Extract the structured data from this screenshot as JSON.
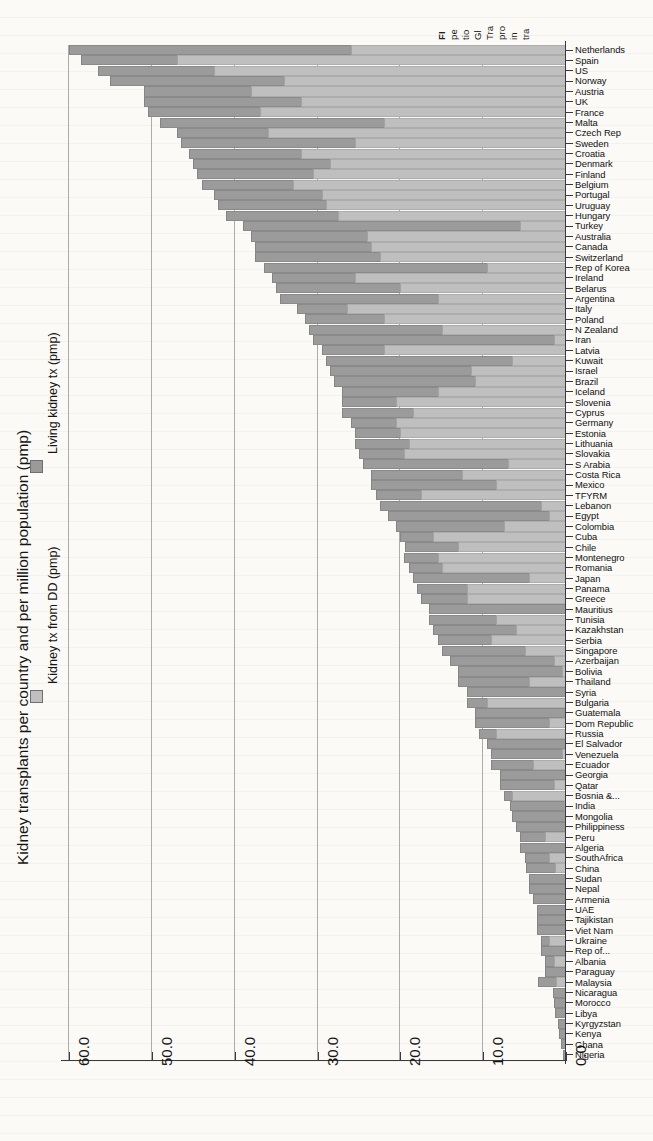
{
  "figure": {
    "caption_lines": [
      "FI",
      "pe",
      "tio",
      "Gl",
      "Tra",
      "pro",
      "in",
      "tra"
    ]
  },
  "axis": {
    "title": "Kidney transplants per country and per million population (pmp)",
    "tick_labels": [
      "60.0",
      "50.0",
      "40.0",
      "30.0",
      "20.0",
      "10.0",
      "0.0"
    ]
  },
  "legend": {
    "items": [
      {
        "label": "Kidney tx from DD (pmp)",
        "color": "#c0c0c0"
      },
      {
        "label": "Living kidney tx (pmp)",
        "color": "#9a9a9a"
      }
    ]
  },
  "chart_data": {
    "type": "bar",
    "orientation": "horizontal-stacked",
    "title": "Kidney transplants per country and per million population (pmp)",
    "xlabel": "Kidney transplants per country and per million population (pmp)",
    "ylabel": "",
    "xlim": [
      0,
      60
    ],
    "x_axis_reversed": true,
    "grid": true,
    "legend_position": "left",
    "ticks": [
      60.0,
      50.0,
      40.0,
      30.0,
      20.0,
      10.0,
      0.0
    ],
    "series": [
      {
        "name": "Kidney tx from DD (pmp)",
        "color": "#c0c0c0"
      },
      {
        "name": "Living kidney tx (pmp)",
        "color": "#9a9a9a"
      }
    ],
    "categories": [
      "Netherlands",
      "Spain",
      "US",
      "Norway",
      "Austria",
      "UK",
      "France",
      "Malta",
      "Czech Rep",
      "Sweden",
      "Croatia",
      "Denmark",
      "Finland",
      "Belgium",
      "Portugal",
      "Uruguay",
      "Hungary",
      "Turkey",
      "Australia",
      "Canada",
      "Switzerland",
      "Rep of Korea",
      "Ireland",
      "Belarus",
      "Argentina",
      "Italy",
      "Poland",
      "N Zealand",
      "Iran",
      "Latvia",
      "Kuwait",
      "Israel",
      "Brazil",
      "Iceland",
      "Slovenia",
      "Cyprus",
      "Germany",
      "Estonia",
      "Lithuania",
      "Slovakia",
      "S Arabia",
      "Costa Rica",
      "Mexico",
      "TFYRM",
      "Lebanon",
      "Egypt",
      "Colombia",
      "Cuba",
      "Chile",
      "Montenegro",
      "Romania",
      "Japan",
      "Panama",
      "Greece",
      "Mauritius",
      "Tunisia",
      "Kazakhstan",
      "Serbia",
      "Singapore",
      "Azerbaijan",
      "Bolivia",
      "Thailand",
      "Syria",
      "Bulgaria",
      "Guatemala",
      "Dom Republic",
      "Russia",
      "El Salvador",
      "Venezuela",
      "Ecuador",
      "Georgia",
      "Qatar",
      "Bosnia &...",
      "India",
      "Mongolia",
      "Philippiness",
      "Peru",
      "Algeria",
      "SouthAfrica",
      "China",
      "Sudan",
      "Nepal",
      "Armenia",
      "UAE",
      "Tajikistan",
      "Viet Nam",
      "Ukraine",
      "Rep of...",
      "Albania",
      "Paraguay",
      "Malaysia",
      "Nicaragua",
      "Morocco",
      "Libya",
      "Kyrgyzstan",
      "Kenya",
      "Ghana",
      "Nigeria"
    ],
    "dd_values": [
      26.0,
      47.0,
      42.5,
      34.0,
      38.0,
      32.0,
      37.0,
      22.0,
      36.0,
      25.5,
      32.0,
      28.5,
      30.5,
      33.0,
      29.5,
      29.0,
      27.5,
      5.5,
      24.0,
      23.5,
      22.5,
      9.5,
      25.5,
      20.0,
      15.5,
      26.5,
      22.0,
      15.0,
      1.5,
      22.0,
      6.5,
      11.5,
      11.0,
      15.5,
      20.5,
      18.5,
      20.5,
      20.0,
      19.0,
      19.5,
      7.0,
      12.5,
      8.5,
      17.5,
      3.0,
      2.0,
      7.5,
      16.0,
      13.0,
      15.5,
      15.0,
      4.5,
      12.0,
      12.0,
      0.0,
      8.5,
      6.0,
      9.0,
      5.0,
      1.5,
      0.5,
      4.5,
      0.0,
      9.5,
      0.0,
      2.0,
      8.5,
      0.0,
      0.5,
      4.0,
      0.0,
      1.5,
      6.5,
      0.3,
      0.0,
      0.0,
      2.5,
      0.0,
      2.0,
      1.3,
      0.0,
      0.0,
      0.0,
      0.0,
      0.0,
      0.0,
      2.0,
      0.0,
      1.5,
      0.0,
      1.2,
      0.0,
      0.0,
      0.0,
      0.0,
      0.0,
      0.0,
      0.0
    ],
    "living_values": [
      34.0,
      11.5,
      14.0,
      21.0,
      13.0,
      19.0,
      13.5,
      27.0,
      11.0,
      21.0,
      13.5,
      16.5,
      14.0,
      11.0,
      13.0,
      13.0,
      13.5,
      33.5,
      14.0,
      14.0,
      15.0,
      27.0,
      10.0,
      15.0,
      19.0,
      6.0,
      9.5,
      16.0,
      29.0,
      7.5,
      22.5,
      17.0,
      17.0,
      11.5,
      6.5,
      8.5,
      5.5,
      5.5,
      6.5,
      5.5,
      17.5,
      11.0,
      15.0,
      5.5,
      19.5,
      19.5,
      13.0,
      4.0,
      6.5,
      4.0,
      4.0,
      14.0,
      6.0,
      5.5,
      16.5,
      8.0,
      10.0,
      6.5,
      10.0,
      12.5,
      12.5,
      8.5,
      12.0,
      2.5,
      11.0,
      9.0,
      2.0,
      9.5,
      8.5,
      5.0,
      8.0,
      6.5,
      1.0,
      6.5,
      6.5,
      6.0,
      3.0,
      5.5,
      3.0,
      3.5,
      4.5,
      4.5,
      4.0,
      3.5,
      3.5,
      3.5,
      1.0,
      3.0,
      1.0,
      2.5,
      2.2,
      1.6,
      1.5,
      1.3,
      1.0,
      0.8,
      0.6,
      0.4
    ]
  }
}
